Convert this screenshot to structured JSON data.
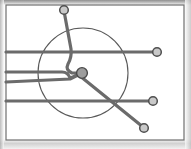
{
  "document": {
    "title": "Schematic Routing Diagram",
    "kind": "line-routing-schematic",
    "width": 191,
    "height": 149,
    "background_color": "#fdfdfd",
    "scan_edge_color": "#9a9a9a"
  },
  "frame": {
    "name": "page-frame",
    "x": 6,
    "y": 5,
    "width": 178,
    "height": 135,
    "stroke_color": "#6f6f6f",
    "stroke_width": 1.2,
    "fill_color": "#ffffff"
  },
  "boundary_circle": {
    "name": "boundary-circle",
    "center_x": 83,
    "center_y": 73,
    "radius": 45,
    "stroke_color": "#595959",
    "stroke_width": 1.1,
    "fill_color": "none"
  },
  "hub": {
    "name": "central-hub-node",
    "center_x": 82,
    "center_y": 73,
    "radius": 5.4,
    "fill_color": "#9d9d9d",
    "stroke_color": "#4a4a4a",
    "stroke_width": 1.4
  },
  "styles": {
    "route_stroke_color": "#6b6b6b",
    "route_stroke_width": 3.2,
    "terminal_fill_color": "#c9c9c9",
    "terminal_stroke_color": "#4f4f4f",
    "terminal_stroke_width": 1.5,
    "terminal_radius": 4.3
  },
  "routes": [
    {
      "id": "route-1",
      "name": "route-left-top-to-right-upper",
      "label": "Upper through line",
      "path": "M 6 52 L 156 52",
      "stroke_color": "#6b6b6b",
      "stroke_width": 3.2
    },
    {
      "id": "route-2",
      "name": "route-left-mid-upper-to-hub",
      "label": "Mid-upper feed into hub",
      "path": "M 6 72 L 62 72 Q 68 72 70 78 L 73 77 L 78 74",
      "stroke_color": "#6b6b6b",
      "stroke_width": 3.2
    },
    {
      "id": "route-3",
      "name": "route-left-mid-lower-to-hub",
      "label": "Mid-lower feed into hub",
      "path": "M 6 82 L 70 79 L 78 75",
      "stroke_color": "#6b6b6b",
      "stroke_width": 3.2
    },
    {
      "id": "route-4",
      "name": "route-left-bottom-to-right-lower",
      "label": "Lower through line",
      "path": "M 6 101 L 152 101",
      "stroke_color": "#6b6b6b",
      "stroke_width": 3.2
    },
    {
      "id": "route-5",
      "name": "route-top-node-to-hub",
      "label": "Top node descending branch into hub",
      "path": "M 64 11 L 71 49 Q 72 57 68 64 Q 65 70 72 73 L 78 73",
      "stroke_color": "#6b6b6b",
      "stroke_width": 3.2
    },
    {
      "id": "route-6",
      "name": "route-hub-to-bottom-right-node",
      "label": "Hub diagonal to bottom-right node",
      "path": "M 80 76 L 143 127",
      "stroke_color": "#6b6b6b",
      "stroke_width": 3.2
    }
  ],
  "terminals": [
    {
      "id": "terminal-top",
      "name": "terminal-node-top",
      "label": "Top terminal",
      "cx": 64,
      "cy": 10,
      "r": 4.3
    },
    {
      "id": "terminal-right-upper",
      "name": "terminal-node-right-upper",
      "label": "Right upper terminal",
      "cx": 157,
      "cy": 52,
      "r": 4.3
    },
    {
      "id": "terminal-right-lower",
      "name": "terminal-node-right-lower",
      "label": "Right lower terminal",
      "cx": 153,
      "cy": 101,
      "r": 4.3
    },
    {
      "id": "terminal-bottom-right",
      "name": "terminal-node-bottom-right",
      "label": "Bottom right terminal",
      "cx": 144,
      "cy": 128,
      "r": 4.3
    }
  ]
}
